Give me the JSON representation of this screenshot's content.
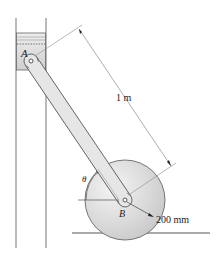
{
  "labels": {
    "point_a": "A",
    "point_b": "B",
    "angle": "θ",
    "rod_length": "1 m",
    "wheel_radius": "200 mm"
  },
  "colors": {
    "stroke": "#555555",
    "rod_fill": "#e4e4e4",
    "wheel_fill": "#dcdcdc",
    "piston_fill": "#d6d6d6",
    "dim_line": "#777777"
  }
}
